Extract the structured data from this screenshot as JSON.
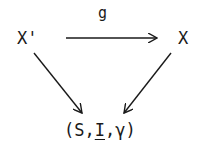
{
  "diagram": {
    "type": "commutative-triangle",
    "nodes": {
      "top_left": "X'",
      "top_right": "X",
      "bottom": {
        "open": "(",
        "first": "S",
        "sep1": ",",
        "second": "I",
        "sep2": ",",
        "third": "γ",
        "close": ")"
      }
    },
    "edges": [
      {
        "from": "X'",
        "to": "X",
        "label": "g"
      },
      {
        "from": "X'",
        "to": "(S,I,γ)",
        "label": ""
      },
      {
        "from": "X",
        "to": "(S,I,γ)",
        "label": ""
      }
    ],
    "colors": {
      "ink": "#1a1a1a",
      "background": "#ffffff"
    }
  }
}
